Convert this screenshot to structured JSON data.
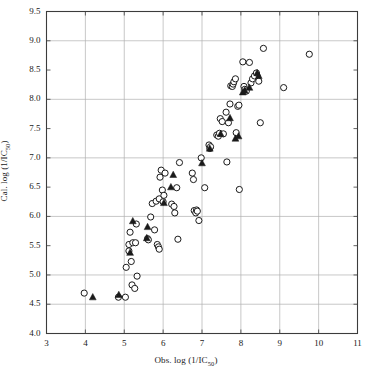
{
  "chart_data": {
    "type": "scatter",
    "title": "",
    "xlabel": "Obs. log (1/IC50)",
    "ylabel": "Cal. log (1/IC50)",
    "xlim": [
      3,
      11
    ],
    "ylim": [
      4.0,
      9.5
    ],
    "xticks": [
      3,
      4,
      5,
      6,
      7,
      8,
      9,
      10,
      11
    ],
    "xtick_labels": [
      "3",
      "4",
      "5",
      "6",
      "7",
      "8",
      "9",
      "10",
      "11"
    ],
    "yticks": [
      4.0,
      4.5,
      5.0,
      5.5,
      6.0,
      6.5,
      7.0,
      7.5,
      8.0,
      8.5,
      9.0,
      9.5
    ],
    "ytick_labels": [
      "4.0",
      "4.5",
      "5.0",
      "5.5",
      "6.0",
      "6.5",
      "7.0",
      "7.5",
      "8.0",
      "8.5",
      "9.0",
      "9.5"
    ],
    "grid": true,
    "grid_x": [
      4,
      5,
      6,
      7,
      8,
      9,
      10
    ],
    "grid_y": [
      4.5,
      5.0,
      6.0,
      7.0,
      8.0,
      9.0
    ],
    "grid_color": "#b0b0b0",
    "axis_color": "#3c3c3c",
    "legend": [],
    "legend_position": "none",
    "series": [
      {
        "name": "Training set",
        "marker": "open-circle",
        "color": "#1a1a1a",
        "fill": "none",
        "points": [
          [
            3.97,
            4.69
          ],
          [
            4.85,
            4.62
          ],
          [
            5.03,
            4.62
          ],
          [
            5.05,
            5.13
          ],
          [
            5.12,
            5.41
          ],
          [
            5.12,
            5.52
          ],
          [
            5.15,
            5.73
          ],
          [
            5.18,
            5.23
          ],
          [
            5.2,
            4.83
          ],
          [
            5.22,
            5.55
          ],
          [
            5.27,
            4.77
          ],
          [
            5.29,
            5.55
          ],
          [
            5.31,
            5.87
          ],
          [
            5.33,
            4.98
          ],
          [
            5.6,
            5.62
          ],
          [
            5.62,
            5.6
          ],
          [
            5.68,
            5.99
          ],
          [
            5.72,
            6.22
          ],
          [
            5.78,
            5.77
          ],
          [
            5.82,
            6.26
          ],
          [
            5.85,
            5.52
          ],
          [
            5.88,
            5.48
          ],
          [
            5.9,
            5.44
          ],
          [
            5.9,
            6.3
          ],
          [
            5.92,
            6.67
          ],
          [
            5.95,
            6.79
          ],
          [
            5.98,
            6.45
          ],
          [
            6.0,
            6.25
          ],
          [
            6.02,
            6.36
          ],
          [
            6.05,
            6.74
          ],
          [
            6.22,
            6.21
          ],
          [
            6.28,
            6.17
          ],
          [
            6.3,
            6.06
          ],
          [
            6.35,
            6.49
          ],
          [
            6.38,
            5.61
          ],
          [
            6.42,
            6.92
          ],
          [
            6.75,
            6.74
          ],
          [
            6.78,
            6.63
          ],
          [
            6.8,
            6.1
          ],
          [
            6.84,
            6.06
          ],
          [
            6.86,
            6.11
          ],
          [
            6.88,
            6.09
          ],
          [
            6.92,
            5.93
          ],
          [
            6.98,
            7.0
          ],
          [
            7.07,
            6.49
          ],
          [
            7.18,
            7.22
          ],
          [
            7.2,
            7.16
          ],
          [
            7.22,
            7.19
          ],
          [
            7.38,
            7.39
          ],
          [
            7.42,
            7.37
          ],
          [
            7.45,
            7.42
          ],
          [
            7.47,
            7.67
          ],
          [
            7.52,
            7.62
          ],
          [
            7.55,
            7.41
          ],
          [
            7.62,
            7.78
          ],
          [
            7.64,
            6.93
          ],
          [
            7.68,
            7.6
          ],
          [
            7.72,
            7.92
          ],
          [
            7.74,
            8.23
          ],
          [
            7.78,
            8.22
          ],
          [
            7.8,
            8.26
          ],
          [
            7.82,
            8.3
          ],
          [
            7.86,
            8.35
          ],
          [
            7.88,
            7.43
          ],
          [
            7.92,
            7.88
          ],
          [
            7.95,
            7.9
          ],
          [
            7.96,
            6.46
          ],
          [
            8.05,
            8.64
          ],
          [
            8.08,
            8.22
          ],
          [
            8.1,
            8.17
          ],
          [
            8.14,
            8.14
          ],
          [
            8.22,
            8.63
          ],
          [
            8.26,
            8.28
          ],
          [
            8.3,
            8.35
          ],
          [
            8.35,
            8.4
          ],
          [
            8.4,
            8.45
          ],
          [
            8.46,
            8.31
          ],
          [
            8.5,
            7.6
          ],
          [
            8.58,
            8.87
          ],
          [
            9.1,
            8.2
          ],
          [
            9.76,
            8.77
          ]
        ]
      },
      {
        "name": "Test set",
        "marker": "filled-triangle",
        "color": "#1a1a1a",
        "fill": "#1a1a1a",
        "points": [
          [
            4.19,
            4.62
          ],
          [
            4.86,
            4.66
          ],
          [
            5.15,
            5.38
          ],
          [
            5.22,
            5.92
          ],
          [
            5.58,
            5.63
          ],
          [
            5.6,
            5.82
          ],
          [
            6.02,
            6.23
          ],
          [
            6.2,
            6.5
          ],
          [
            6.26,
            6.71
          ],
          [
            7.0,
            6.91
          ],
          [
            7.2,
            7.16
          ],
          [
            7.48,
            7.41
          ],
          [
            7.72,
            7.68
          ],
          [
            7.86,
            7.33
          ],
          [
            7.94,
            7.37
          ],
          [
            8.05,
            8.12
          ],
          [
            8.1,
            8.15
          ],
          [
            8.22,
            8.2
          ],
          [
            8.42,
            8.45
          ],
          [
            8.46,
            8.4
          ]
        ]
      }
    ]
  }
}
